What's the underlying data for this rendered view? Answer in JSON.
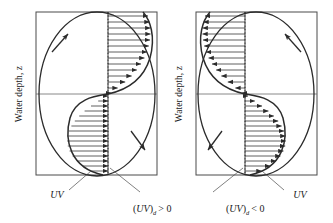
{
  "figure": {
    "type": "diagram",
    "background_color": "#ffffff",
    "line_color": "#2b2b2b",
    "panels": [
      {
        "id": "left",
        "axis_label_y": "Water depth, z",
        "axis_label_x": "UV",
        "caption_open": "(",
        "caption_var": "UV",
        "caption_close": ")",
        "caption_sub": "d",
        "caption_rel": "> 0",
        "caption_full": "(UV)d > 0",
        "circulation_direction": "clockwise",
        "profile_shape": "S-curve from lower-left to upper-right",
        "arrow_direction_upper": "right",
        "arrow_direction_lower": "right",
        "box": {
          "x": 36,
          "y": 12,
          "width": 121,
          "height": 163
        },
        "centerline_x": 108,
        "midline_y": 94,
        "n_arrows_upper": 14,
        "n_arrows_lower": 14
      },
      {
        "id": "right",
        "axis_label_y": "Water depth, z",
        "axis_label_x": "UV",
        "caption_open": "(",
        "caption_var": "UV",
        "caption_close": ")",
        "caption_sub": "d",
        "caption_rel": "< 0",
        "caption_full": "(UV)d < 0",
        "circulation_direction": "counter-clockwise",
        "profile_shape": "S-curve from upper-left to lower-right",
        "arrow_direction_upper": "left",
        "arrow_direction_lower": "right",
        "box": {
          "x": 196,
          "y": 12,
          "width": 121,
          "height": 163
        },
        "centerline_x": 245,
        "midline_y": 94,
        "n_arrows_upper": 14,
        "n_arrows_lower": 14
      }
    ]
  }
}
